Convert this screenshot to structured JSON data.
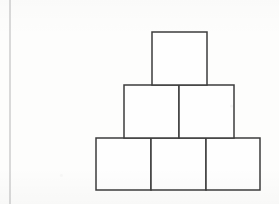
{
  "figure": {
    "canvas": {
      "width": 279,
      "height": 204
    },
    "colors": {
      "background": "#fdfdfc",
      "stroke": "#3c3c3c",
      "fill": "#fefefe",
      "margin_rule": "#bcbcbc"
    },
    "stroke_width": 1.5,
    "margin_rule": {
      "x": 10,
      "y1": 0,
      "y2": 204,
      "width": 1.1
    },
    "rows": [
      {
        "name": "top-row",
        "count": 1,
        "y": 32,
        "height": 53,
        "blocks": [
          {
            "name": "block-top-1",
            "x": 152,
            "y": 32,
            "width": 55,
            "height": 53
          }
        ]
      },
      {
        "name": "middle-row",
        "count": 2,
        "y": 85,
        "height": 53,
        "blocks": [
          {
            "name": "block-middle-1",
            "x": 124,
            "y": 85,
            "width": 55,
            "height": 53
          },
          {
            "name": "block-middle-2",
            "x": 179,
            "y": 85,
            "width": 55,
            "height": 53
          }
        ]
      },
      {
        "name": "bottom-row",
        "count": 3,
        "y": 138,
        "height": 52,
        "blocks": [
          {
            "name": "block-bottom-1",
            "x": 96,
            "y": 138,
            "width": 55,
            "height": 52
          },
          {
            "name": "block-bottom-2",
            "x": 151,
            "y": 138,
            "width": 55,
            "height": 52
          },
          {
            "name": "block-bottom-3",
            "x": 206,
            "y": 138,
            "width": 54,
            "height": 52
          }
        ]
      }
    ],
    "total_blocks": 6
  }
}
